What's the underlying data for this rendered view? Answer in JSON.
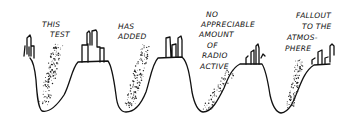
{
  "illustration": {
    "style": "hand-drawn cartoon",
    "ink_color": "#111111",
    "background_color": "#ffffff",
    "panels": [
      {
        "caption_lines": [
          "THIS",
          "TEST"
        ]
      },
      {
        "caption_lines": [
          "HAS",
          "ADDED"
        ]
      },
      {
        "caption_lines": [
          "NO",
          "APPRECIABLE",
          "AMOUNT",
          "OF",
          "RADIO",
          "ACTIVE"
        ]
      },
      {
        "caption_lines": [
          "FALLOUT",
          "TO THE",
          "ATMOS-",
          "PHERE"
        ]
      }
    ],
    "full_caption": "THIS TEST HAS ADDED NO APPRECIABLE AMOUNT OF RADIO ACTIVE FALLOUT TO THE ATMOSPHERE"
  }
}
